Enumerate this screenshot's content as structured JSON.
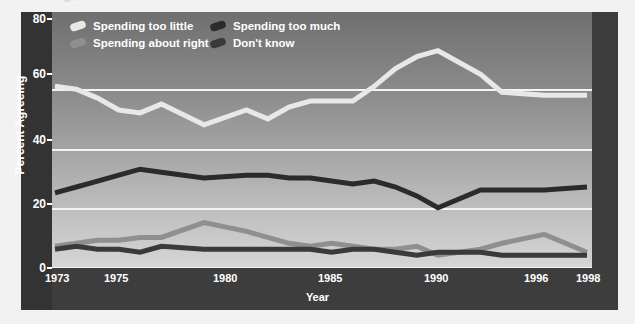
{
  "title_remnant": "\"\"                                          .",
  "colors": {
    "frame": "#3d3d3d",
    "frame_left": "#333333",
    "gridline": "#f4f4f4",
    "axis_text": "#ffffff",
    "too_little": "#e8e8e4",
    "about_right": "#8f8f8f",
    "too_much": "#2b2b2b",
    "dont_know": "#3a3a3a"
  },
  "axes": {
    "ylabel": "Percent Agreeing",
    "xlabel": "Year",
    "yticks": [
      "0",
      "20",
      "40",
      "60",
      "80"
    ],
    "xticks": [
      "1973",
      "1975",
      "1980",
      "1985",
      "1990",
      "1996",
      "1998"
    ]
  },
  "legend": {
    "row1": [
      {
        "label": "Spending too little",
        "key": "too_little"
      },
      {
        "label": "Spending too much",
        "key": "too_much"
      }
    ],
    "row2": [
      {
        "label": "Spending about right",
        "key": "about_right"
      },
      {
        "label": "Don't know",
        "key": "dont_know"
      }
    ]
  },
  "chart_data": {
    "type": "line",
    "title": "",
    "xlabel": "Year",
    "ylabel": "Percent Agreeing",
    "ylim": [
      0,
      80
    ],
    "yticks": [
      0,
      20,
      40,
      60,
      80
    ],
    "xlim": [
      1973,
      1998
    ],
    "xticks": [
      1973,
      1975,
      1980,
      1985,
      1990,
      1996,
      1998
    ],
    "grid": "horizontal",
    "legend_position": "top-inside",
    "x": [
      1973,
      1974,
      1975,
      1976,
      1977,
      1978,
      1980,
      1982,
      1983,
      1984,
      1985,
      1986,
      1987,
      1988,
      1989,
      1990,
      1991,
      1993,
      1994,
      1996,
      1998
    ],
    "series": [
      {
        "name": "Spending too little",
        "color": "#e8e8e4",
        "values": [
          61,
          60,
          57,
          53,
          52,
          55,
          48,
          53,
          50,
          54,
          56,
          56,
          56,
          61,
          67,
          71,
          73,
          65,
          59,
          58,
          58
        ]
      },
      {
        "name": "Spending too much",
        "color": "#2b2b2b",
        "values": [
          25,
          27,
          29,
          31,
          33,
          32,
          30,
          31,
          31,
          30,
          30,
          29,
          28,
          29,
          27,
          24,
          20,
          26,
          26,
          26,
          27
        ]
      },
      {
        "name": "Spending about right",
        "color": "#8f8f8f",
        "values": [
          7,
          8,
          9,
          9,
          10,
          10,
          15,
          12,
          10,
          8,
          7,
          8,
          7,
          6,
          6,
          7,
          4,
          6,
          8,
          11,
          5
        ]
      },
      {
        "name": "Don't know",
        "color": "#3a3a3a",
        "values": [
          6,
          7,
          6,
          6,
          5,
          7,
          6,
          6,
          6,
          6,
          6,
          5,
          6,
          6,
          5,
          4,
          5,
          5,
          4,
          4,
          4
        ]
      }
    ]
  }
}
